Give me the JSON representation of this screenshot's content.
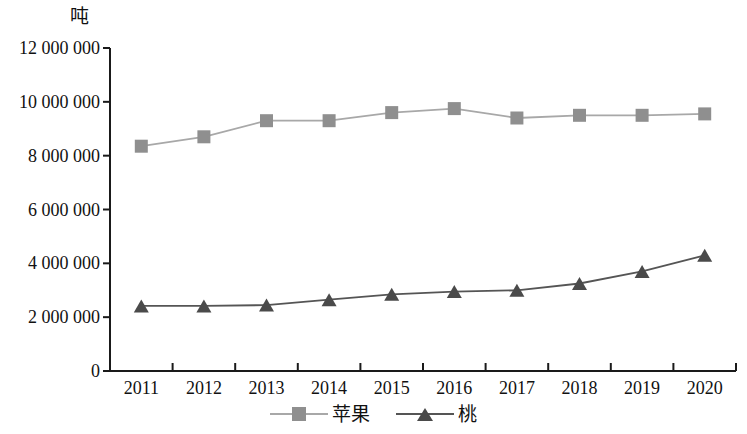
{
  "chart_data": {
    "type": "line",
    "title": "",
    "subtitle": "",
    "xlabel": "",
    "ylabel": "吨",
    "categories": [
      "2011",
      "2012",
      "2013",
      "2014",
      "2015",
      "2016",
      "2017",
      "2018",
      "2019",
      "2020"
    ],
    "ylim": [
      0,
      12000000
    ],
    "yticks": [
      0,
      2000000,
      4000000,
      6000000,
      8000000,
      10000000,
      12000000
    ],
    "ytick_labels": [
      "0",
      "2 000 000",
      "4 000 000",
      "6 000 000",
      "8 000 000",
      "10 000 000",
      "12 000 000"
    ],
    "grid": false,
    "legend_position": "bottom",
    "series": [
      {
        "name": "苹果",
        "marker": "square",
        "color": "#8f8f8f",
        "line_color": "#a8a8a8",
        "values": [
          8350000,
          8700000,
          9300000,
          9300000,
          9600000,
          9750000,
          9400000,
          9500000,
          9500000,
          9550000
        ]
      },
      {
        "name": "桃",
        "marker": "triangle",
        "color": "#4a4a4a",
        "line_color": "#555555",
        "values": [
          2420000,
          2420000,
          2450000,
          2650000,
          2850000,
          2950000,
          3000000,
          3250000,
          3700000,
          4300000
        ]
      }
    ],
    "axis_color": "#1a1a1a"
  }
}
